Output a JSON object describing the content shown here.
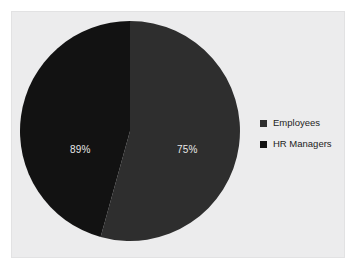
{
  "chart_data": {
    "type": "pie",
    "title": "",
    "categories": [
      "Employees",
      "HR Managers"
    ],
    "values": [
      89,
      75
    ],
    "data_labels": [
      "89%",
      "75%"
    ],
    "shares_percent": [
      54.3,
      45.7
    ],
    "colors": [
      "#2e2e2e",
      "#121212"
    ],
    "legend": {
      "position": "right",
      "entries": [
        {
          "label": "Employees",
          "color": "#2e2e2e"
        },
        {
          "label": "HR Managers",
          "color": "#121212"
        }
      ]
    },
    "grid": false,
    "xlabel": "",
    "ylabel": ""
  },
  "panel": {
    "background": "#ececed",
    "border_color": "#e2e2e3"
  },
  "pie": {
    "center_x": 118,
    "center_y": 119,
    "radius": 110,
    "start_angle_deg": 0
  }
}
